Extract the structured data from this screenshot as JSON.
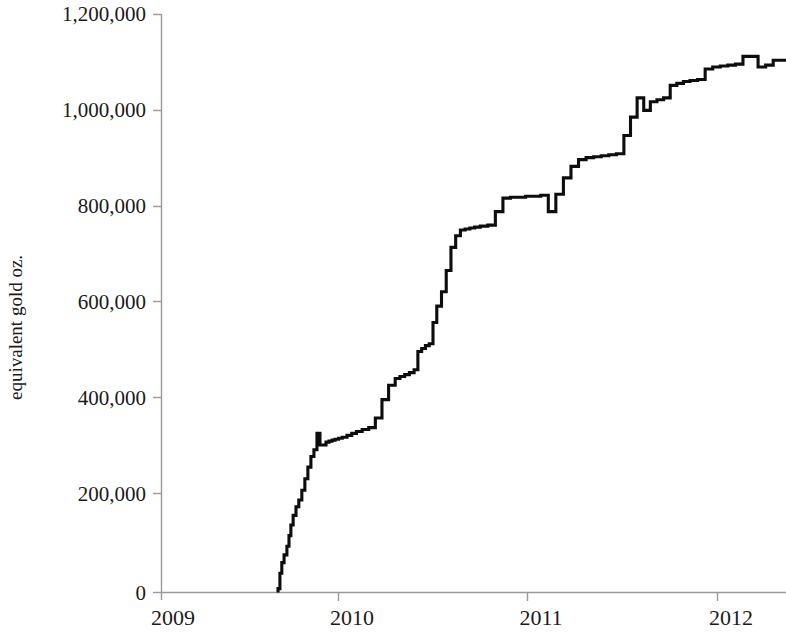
{
  "chart_data": {
    "type": "line",
    "subtype": "step-after",
    "title": "",
    "subtitle": "",
    "xlabel": "",
    "ylabel": "equivalent gold oz.",
    "xlim": [
      2009.0,
      2012.37
    ],
    "ylim": [
      0,
      1200000
    ],
    "grid": false,
    "legend": null,
    "x_tick_labels": [
      "2009",
      "2010",
      "2011",
      "2012"
    ],
    "x_ticks": [
      2009,
      2010,
      2011,
      2012
    ],
    "y_tick_labels": [
      "0",
      "200,000",
      "400,000",
      "600,000",
      "800,000",
      "1,000,000",
      "1,200,000"
    ],
    "y_ticks": [
      0,
      200000,
      400000,
      600000,
      800000,
      1000000,
      1200000
    ],
    "series": [
      {
        "name": "cumulative equivalent gold oz.",
        "color": "#0d0d0d",
        "x": [
          2009.68,
          2009.69,
          2009.7,
          2009.712,
          2009.727,
          2009.738,
          2009.748,
          2009.76,
          2009.775,
          2009.79,
          2009.806,
          2009.822,
          2009.838,
          2009.854,
          2009.87,
          2009.886,
          2009.902,
          2009.918,
          2009.934,
          2009.95,
          2009.966,
          2009.982,
          2010.0,
          2010.02,
          2010.045,
          2010.07,
          2010.095,
          2010.125,
          2010.16,
          2010.195,
          2010.23,
          2010.265,
          2010.3,
          2010.325,
          2010.35,
          2010.375,
          2010.4,
          2010.42,
          2010.44,
          2010.46,
          2010.48,
          2010.5,
          2010.52,
          2010.545,
          2010.57,
          2010.595,
          2010.62,
          2010.645,
          2010.67,
          2010.695,
          2010.72,
          2010.75,
          2010.79,
          2010.83,
          2010.87,
          2010.91,
          2010.95,
          2010.99,
          2011.03,
          2011.07,
          2011.11,
          2011.15,
          2011.19,
          2011.23,
          2011.27,
          2011.31,
          2011.35,
          2011.39,
          2011.43,
          2011.47,
          2011.51,
          2011.545,
          2011.58,
          2011.615,
          2011.65,
          2011.685,
          2011.72,
          2011.755,
          2011.79,
          2011.825,
          2011.86,
          2011.9,
          2011.94,
          2011.98,
          2012.02,
          2012.06,
          2012.1,
          2012.14,
          2012.18,
          2012.22,
          2012.26,
          2012.3,
          2012.37
        ],
        "y": [
          8000,
          40000,
          62000,
          78000,
          96000,
          118000,
          140000,
          160000,
          178000,
          192000,
          212000,
          236000,
          260000,
          282000,
          296000,
          330000,
          306000,
          306000,
          312000,
          314000,
          316000,
          318000,
          320000,
          322000,
          326000,
          330000,
          334000,
          338000,
          342000,
          362000,
          400000,
          430000,
          444000,
          448000,
          452000,
          456000,
          462000,
          500000,
          506000,
          512000,
          516000,
          560000,
          594000,
          624000,
          668000,
          716000,
          740000,
          752000,
          754000,
          756000,
          758000,
          760000,
          762000,
          790000,
          818000,
          820000,
          820000,
          822000,
          822000,
          824000,
          790000,
          826000,
          860000,
          884000,
          898000,
          902000,
          904000,
          906000,
          908000,
          910000,
          948000,
          986000,
          1026000,
          1000000,
          1018000,
          1022000,
          1026000,
          1052000,
          1056000,
          1060000,
          1062000,
          1064000,
          1086000,
          1090000,
          1092000,
          1094000,
          1096000,
          1112000,
          1112000,
          1090000,
          1094000,
          1104000,
          1106000
        ]
      }
    ],
    "annotations": []
  },
  "figure": {
    "background_color": "#ffffff",
    "axis_color": "#9a9a9a",
    "text_color": "#1a1a1a"
  }
}
